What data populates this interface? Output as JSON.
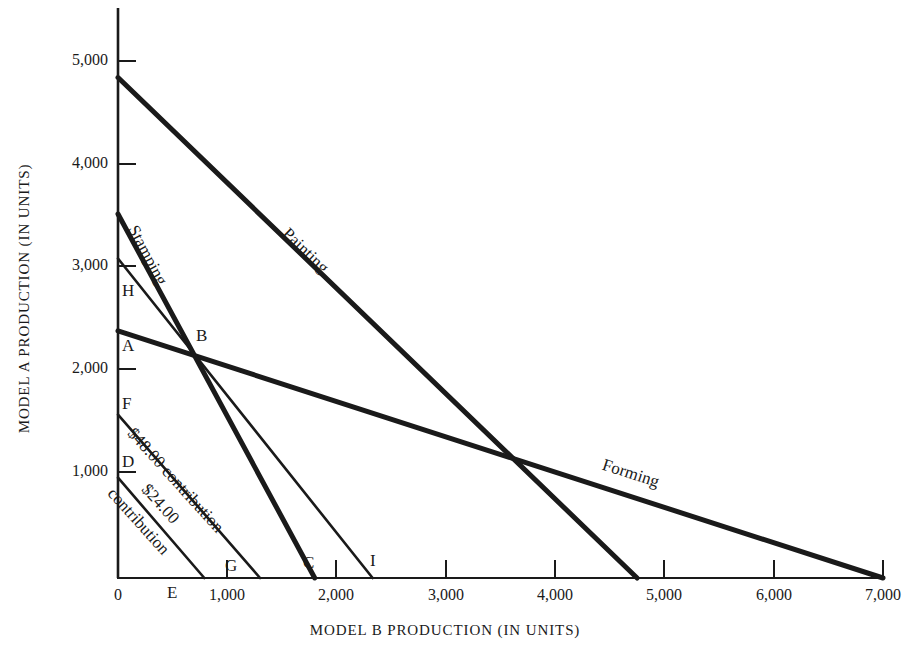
{
  "chart_data": {
    "type": "line",
    "title": "",
    "xlabel": "MODEL B PRODUCTION  (IN UNITS)",
    "ylabel": "MODEL A PRODUCTION  (IN UNITS)",
    "xlim": [
      0,
      7300
    ],
    "ylim": [
      0,
      5250
    ],
    "grid": false,
    "legend": "inline-curve-labels",
    "xticks": [
      {
        "value": 0,
        "label": "0"
      },
      {
        "value": 1000,
        "label": "1,000"
      },
      {
        "value": 2000,
        "label": "2,000"
      },
      {
        "value": 3000,
        "label": "3,000"
      },
      {
        "value": 4000,
        "label": "4,000"
      },
      {
        "value": 5000,
        "label": "5,000"
      },
      {
        "value": 6000,
        "label": "6,000"
      },
      {
        "value": 7000,
        "label": "7,000"
      }
    ],
    "yticks": [
      {
        "value": 1000,
        "label": "1,000"
      },
      {
        "value": 2000,
        "label": "2,000"
      },
      {
        "value": 3000,
        "label": "3,000"
      },
      {
        "value": 4000,
        "label": "4,000"
      },
      {
        "value": 5000,
        "label": "5,000"
      }
    ],
    "series": [
      {
        "name": "Painting",
        "label": "Painting",
        "kind": "constraint",
        "width": "thick",
        "points": [
          [
            0,
            4840
          ],
          [
            4750,
            0
          ]
        ]
      },
      {
        "name": "Forming",
        "label": "Forming",
        "kind": "constraint",
        "width": "thick",
        "points": [
          [
            0,
            2390
          ],
          [
            7000,
            0
          ]
        ]
      },
      {
        "name": "Stamping",
        "label": "Stamping",
        "kind": "constraint",
        "width": "thick",
        "points": [
          [
            0,
            3520
          ],
          [
            1800,
            0
          ]
        ]
      },
      {
        "name": "capacity-H-I",
        "label": "",
        "kind": "capacity",
        "width": "thin",
        "points": [
          [
            0,
            3090
          ],
          [
            2330,
            0
          ]
        ]
      },
      {
        "name": "contribution-48",
        "label": "$48.00 contribution",
        "kind": "isocontribution",
        "width": "thin",
        "points": [
          [
            0,
            1580
          ],
          [
            1300,
            0
          ]
        ]
      },
      {
        "name": "contribution-24",
        "label": "$24.00 contribution",
        "kind": "isocontribution",
        "width": "thin",
        "points": [
          [
            0,
            970
          ],
          [
            790,
            0
          ]
        ]
      }
    ],
    "annotations": [
      {
        "id": "H",
        "label": "H",
        "x": 0,
        "y": 3090,
        "axis": "y-intercept"
      },
      {
        "id": "A",
        "label": "A",
        "x": 0,
        "y": 2390,
        "axis": "y-intercept"
      },
      {
        "id": "B",
        "label": "B",
        "x": 690,
        "y": 2165,
        "axis": "intersection"
      },
      {
        "id": "F",
        "label": "F",
        "x": 0,
        "y": 1580,
        "axis": "y-intercept"
      },
      {
        "id": "D",
        "label": "D",
        "x": 0,
        "y": 970,
        "axis": "y-intercept"
      },
      {
        "id": "E",
        "label": "E",
        "x": 790,
        "y": 0,
        "axis": "x-intercept"
      },
      {
        "id": "G",
        "label": "G",
        "x": 1300,
        "y": 0,
        "axis": "x-intercept"
      },
      {
        "id": "C",
        "label": "C",
        "x": 1800,
        "y": 0,
        "axis": "x-intercept"
      },
      {
        "id": "I",
        "label": "I",
        "x": 2330,
        "y": 0,
        "axis": "x-intercept"
      }
    ]
  },
  "axes": {
    "y_title": "MODEL A PRODUCTION  (IN UNITS)",
    "x_title": "MODEL B PRODUCTION  (IN UNITS)",
    "y_tick_labels": [
      "5,000",
      "4,000",
      "3,000",
      "2,000",
      "1,000"
    ],
    "x_tick_labels": [
      "0",
      "1,000",
      "2,000",
      "3,000",
      "4,000",
      "5,000",
      "6,000",
      "7,000"
    ]
  },
  "curve_labels": {
    "painting": "Painting",
    "forming": "Forming",
    "stamping": "Stamping",
    "contribution_48": "$48.00  contribution",
    "contribution_24": "$24.00",
    "contribution_24b": "contribution"
  },
  "point_labels": {
    "H": "H",
    "A": "A",
    "B": "B",
    "F": "F",
    "D": "D",
    "E": "E",
    "G": "G",
    "C": "C",
    "I": "I"
  },
  "colors": {
    "ink": "#1a1a1a",
    "background": "#ffffff"
  }
}
